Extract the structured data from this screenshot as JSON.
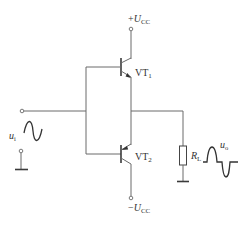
{
  "diagram": {
    "type": "circuit-schematic",
    "supply_positive": {
      "sign": "+",
      "symbol": "U",
      "subscript": "CC"
    },
    "supply_negative": {
      "sign": "−",
      "symbol": "U",
      "subscript": "CC"
    },
    "transistors": [
      {
        "id": "VT1",
        "name": "VT",
        "subscript": "1",
        "kind": "NPN",
        "position": "top"
      },
      {
        "id": "VT2",
        "name": "VT",
        "subscript": "2",
        "kind": "PNP",
        "position": "bottom"
      }
    ],
    "input": {
      "symbol": "u",
      "subscript": "i",
      "waveform": "sine"
    },
    "load": {
      "symbol": "R",
      "subscript": "L"
    },
    "output": {
      "symbol": "u",
      "subscript": "o",
      "waveform": "half-wave pulses with crossover distortion"
    }
  },
  "colors": {
    "line": "#6a6a6a",
    "text": "#333333",
    "background": "#ffffff"
  }
}
